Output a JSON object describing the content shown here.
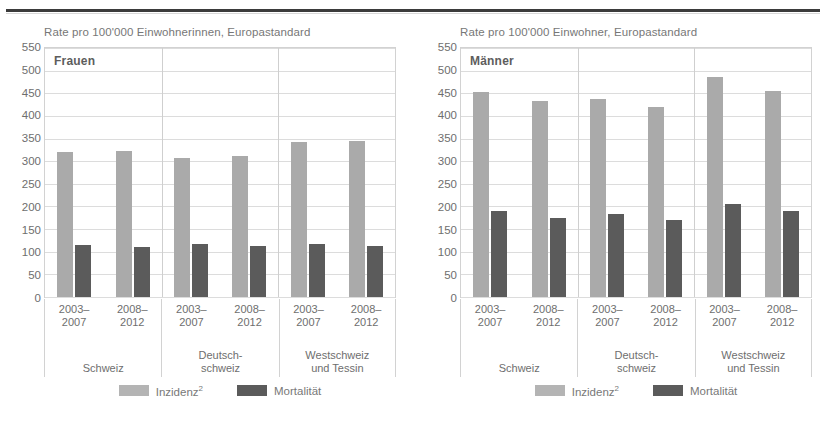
{
  "colors": {
    "incidence": "#aaaaaa",
    "mortality": "#5b5b5b",
    "gridline": "#dcdcdc",
    "text": "#6e6e6e"
  },
  "legend": {
    "incidence_label": "Inzidenz",
    "incidence_superscript": "2",
    "mortality_label": "Mortalität"
  },
  "axis": {
    "ticks": [
      "550",
      "500",
      "450",
      "400",
      "350",
      "300",
      "250",
      "200",
      "150",
      "100",
      "50",
      "0"
    ],
    "periods": [
      "2003–\n2007",
      "2008–\n2012"
    ],
    "period_1_line1": "2003–",
    "period_1_line2": "2007",
    "period_2_line1": "2008–",
    "period_2_line2": "2012",
    "groups": [
      {
        "line1": "",
        "line2": "Schweiz"
      },
      {
        "line1": "Deutsch-",
        "line2": "schweiz"
      },
      {
        "line1": "Westschweiz",
        "line2": "und Tessin"
      }
    ]
  },
  "chart_data": [
    {
      "type": "bar",
      "title": "Frauen",
      "ylabel": "Rate pro 100'000 Einwohnerinnen, Europastandard",
      "xlabel": "",
      "ylim": [
        0,
        550
      ],
      "ytick_step": 50,
      "grid": true,
      "legend_position": "bottom",
      "categories": [
        "Schweiz 2003–2007",
        "Schweiz 2008–2012",
        "Deutschschweiz 2003–2007",
        "Deutschschweiz 2008–2012",
        "Westschweiz und Tessin 2003–2007",
        "Westschweiz und Tessin 2008–2012"
      ],
      "series": [
        {
          "name": "Inzidenz",
          "values": [
            320,
            322,
            308,
            312,
            343,
            345
          ]
        },
        {
          "name": "Mortalität",
          "values": [
            115,
            110,
            118,
            112,
            118,
            112
          ]
        }
      ]
    },
    {
      "type": "bar",
      "title": "Männer",
      "ylabel": "Rate pro 100'000 Einwohner, Europastandard",
      "xlabel": "",
      "ylim": [
        0,
        550
      ],
      "ytick_step": 50,
      "grid": true,
      "legend_position": "bottom",
      "categories": [
        "Schweiz 2003–2007",
        "Schweiz 2008–2012",
        "Deutschschweiz 2003–2007",
        "Deutschschweiz 2008–2012",
        "Westschweiz und Tessin 2003–2007",
        "Westschweiz und Tessin 2008–2012"
      ],
      "series": [
        {
          "name": "Inzidenz",
          "values": [
            452,
            432,
            438,
            420,
            487,
            455
          ]
        },
        {
          "name": "Mortalität",
          "values": [
            190,
            175,
            183,
            170,
            205,
            190
          ]
        }
      ]
    }
  ]
}
